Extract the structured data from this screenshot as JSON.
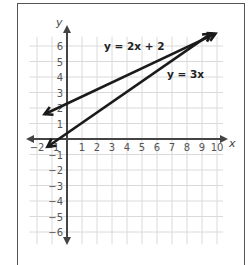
{
  "chart_data": {
    "type": "line",
    "title": "",
    "xlabel": "x",
    "ylabel": "y",
    "xlim": [
      -2,
      10
    ],
    "ylim": [
      -6,
      6
    ],
    "grid": true,
    "x_ticks": [
      "−2",
      "−1",
      "1",
      "2",
      "3",
      "4",
      "5",
      "6",
      "7",
      "8",
      "9",
      "10"
    ],
    "y_ticks": [
      "6",
      "5",
      "4",
      "3",
      "2",
      "1",
      "−1",
      "−2",
      "−3",
      "−4",
      "−5",
      "−6"
    ],
    "series": [
      {
        "name": "y = 2x + 2",
        "equation": "y = 2x + 2",
        "slope": 2,
        "intercept": 2,
        "x": [
          -1,
          0,
          8,
          9
        ],
        "y": [
          0,
          2,
          18,
          20
        ],
        "plotted_segment": {
          "from": [
            -1.5,
            1.6
          ],
          "to": [
            9.9,
            6.8
          ]
        },
        "label_position": [
          2.6,
          5.8
        ]
      },
      {
        "name": "y = 3x",
        "equation": "y = 3x",
        "slope": 3,
        "intercept": 0,
        "x": [
          -1,
          0,
          8,
          9
        ],
        "y": [
          -3,
          0,
          24,
          27
        ],
        "plotted_segment": {
          "from": [
            -1.3,
            -0.5
          ],
          "to": [
            9.6,
            6.8
          ]
        },
        "label_position": [
          8.0,
          3.6
        ]
      }
    ],
    "intersection_note": "Lines drawn crossing near (8, 5.9) as sketched",
    "colors": {
      "lines": "#1a1a1a",
      "axes": "#444444",
      "grid": "#d9d9d9",
      "frame": "#555555"
    }
  },
  "labels": {
    "x_axis": "x",
    "y_axis": "y",
    "eq1": "y = 2x + 2",
    "eq2": "y = 3x"
  }
}
